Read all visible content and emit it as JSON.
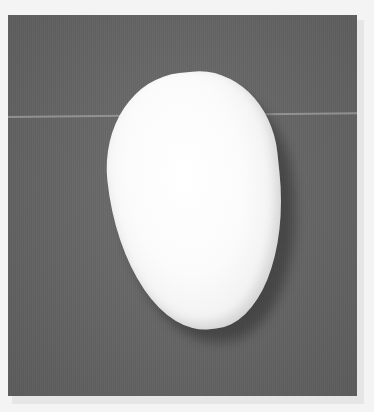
{
  "image": {
    "subject": "white oval bean-shaped object",
    "background": "gray textured surface",
    "frame": "white border",
    "colors": {
      "border": "#f4f4f4",
      "background_gray": "#666666",
      "object_white": "#fafafa",
      "seam_line": "#a0a0a0"
    }
  }
}
